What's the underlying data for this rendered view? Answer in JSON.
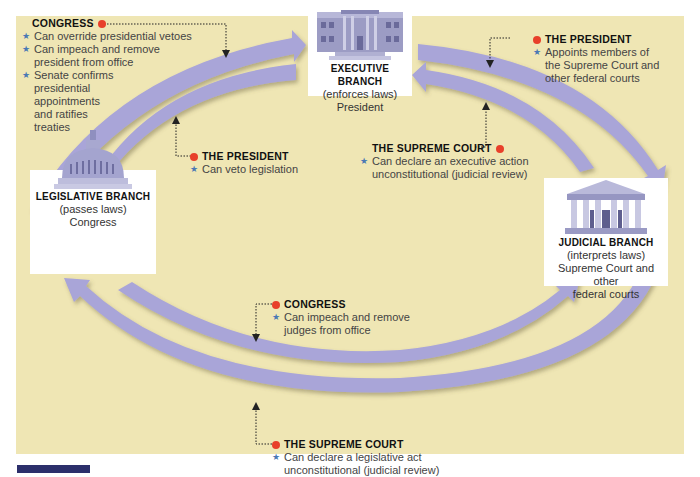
{
  "colors": {
    "background": "#efe6b4",
    "arrow_fill": "#a9a5d8",
    "dot": "#e8402a",
    "star": "#4a78b5",
    "label_bar": "#2c2f6b"
  },
  "branches": {
    "executive": {
      "title": "EXECUTIVE BRANCH",
      "role": "(enforces laws)",
      "body": "President",
      "icon": "white-house-icon"
    },
    "legislative": {
      "title": "LEGISLATIVE BRANCH",
      "role": "(passes laws)",
      "body": "Congress",
      "icon": "capitol-dome-icon"
    },
    "judicial": {
      "title": "JUDICIAL BRANCH",
      "role": "(interprets laws)",
      "body_line1": "Supreme Court and other",
      "body_line2": "federal courts",
      "icon": "supreme-court-icon"
    }
  },
  "checks": {
    "congress_on_president": {
      "head": "CONGRESS",
      "items": [
        "Can override presidential vetoes",
        "Can impeach and remove president from office",
        "Senate confirms presidential appointments and ratifies treaties"
      ],
      "lines": [
        "Can override presidential vetoes",
        "Can impeach and remove",
        "president from office",
        "Senate confirms",
        "presidential",
        "appointments",
        "and ratifies",
        "treaties"
      ]
    },
    "president_on_congress": {
      "head": "THE PRESIDENT",
      "items": [
        "Can veto legislation"
      ]
    },
    "president_on_courts": {
      "head": "THE PRESIDENT",
      "items": [
        "Appoints members of the Supreme Court and other federal courts"
      ],
      "lines": [
        "Appoints members of",
        "the Supreme Court and",
        "other federal courts"
      ]
    },
    "court_on_president": {
      "head": "THE SUPREME COURT",
      "items": [
        "Can declare an executive action unconstitutional (judicial review)"
      ],
      "lines": [
        "Can declare an executive action",
        "unconstitutional (judicial review)"
      ]
    },
    "congress_on_courts": {
      "head": "CONGRESS",
      "items": [
        "Can impeach and remove judges from office"
      ],
      "lines": [
        "Can impeach and remove",
        "judges from office"
      ]
    },
    "court_on_congress": {
      "head": "THE SUPREME COURT",
      "items": [
        "Can declare a legislative act unconstitutional (judicial review)"
      ],
      "lines": [
        "Can declare a legislative act",
        "unconstitutional (judicial review)"
      ]
    }
  },
  "arrows": [
    {
      "from": "legislative",
      "to": "executive",
      "position": "outer-top-left"
    },
    {
      "from": "executive",
      "to": "legislative",
      "position": "inner-top-left"
    },
    {
      "from": "executive",
      "to": "judicial",
      "position": "outer-top-right"
    },
    {
      "from": "judicial",
      "to": "executive",
      "position": "inner-top-right"
    },
    {
      "from": "legislative",
      "to": "judicial",
      "position": "inner-bottom"
    },
    {
      "from": "judicial",
      "to": "legislative",
      "position": "outer-bottom"
    }
  ],
  "icons": {
    "bullet": "★"
  }
}
